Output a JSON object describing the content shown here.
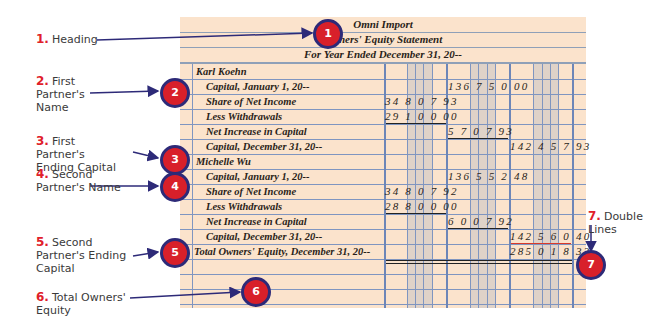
{
  "statement": {
    "heading": {
      "company": "Omni Import",
      "title": "Owners' Equity Statement",
      "period": "For Year Ended December 31, 20--"
    },
    "rows": [
      {
        "desc": "Karl Koehn",
        "indent": false,
        "col1": "",
        "col2": "",
        "col3": ""
      },
      {
        "desc": "Capital, January 1, 20--",
        "indent": true,
        "col1": "",
        "col2": "136 7 5 0 00",
        "col3": ""
      },
      {
        "desc": "Share of Net Income",
        "indent": true,
        "col1": "34 8 0 7 93",
        "col2": "",
        "col3": ""
      },
      {
        "desc": "Less Withdrawals",
        "indent": true,
        "col1": "29 1 0 0 00",
        "col2": "",
        "col3": ""
      },
      {
        "desc": "Net Increase in Capital",
        "indent": true,
        "col1": "",
        "col2": "5 7 0 7 93",
        "col3": ""
      },
      {
        "desc": "Capital, December 31, 20--",
        "indent": true,
        "col1": "",
        "col2": "",
        "col3": "142 4 5 7 93"
      },
      {
        "desc": "Michelle Wu",
        "indent": false,
        "col1": "",
        "col2": "",
        "col3": ""
      },
      {
        "desc": "Capital, January 1, 20--",
        "indent": true,
        "col1": "",
        "col2": "136 5 5 2 48",
        "col3": ""
      },
      {
        "desc": "Share of Net Income",
        "indent": true,
        "col1": "34 8 0 7 92",
        "col2": "",
        "col3": ""
      },
      {
        "desc": "Less Withdrawals",
        "indent": true,
        "col1": "28 8 0 0 00",
        "col2": "",
        "col3": ""
      },
      {
        "desc": "Net Increase in Capital",
        "indent": true,
        "col1": "",
        "col2": "6 0 0 7 92",
        "col3": ""
      },
      {
        "desc": "Capital, December 31, 20--",
        "indent": true,
        "col1": "",
        "col2": "",
        "col3": "142 5 6 0 40"
      },
      {
        "desc": "Total Owners' Equity, December 31, 20--",
        "indent": false,
        "col1": "",
        "col2": "",
        "col3": "285 0 1 8 33"
      }
    ]
  },
  "callouts": [
    {
      "num": "1.",
      "label": "Heading"
    },
    {
      "num": "2.",
      "label": "First Partner's Name"
    },
    {
      "num": "3.",
      "label": "First Partner's Ending Capital"
    },
    {
      "num": "4.",
      "label": "Second Partner's Name"
    },
    {
      "num": "5.",
      "label": "Second Partner's Ending Capital"
    },
    {
      "num": "6.",
      "label": "Total Owners' Equity"
    },
    {
      "num": "7.",
      "label": "Double Lines"
    }
  ],
  "badges": [
    "1",
    "2",
    "3",
    "4",
    "5",
    "6",
    "7"
  ],
  "colors": {
    "paper": "#fbe3cc",
    "grid": "#7f95c0",
    "badge_fill": "#d8202a",
    "badge_border": "#2d2a78",
    "callout_number": "#e0202a",
    "arrow": "#2d2a78"
  }
}
